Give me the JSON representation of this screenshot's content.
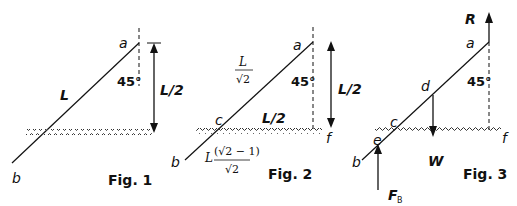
{
  "figures": [
    {
      "id": "fig1",
      "caption": "Fig. 1",
      "labels": {
        "top": "a",
        "bottom": "b",
        "rod_length": "L",
        "angle": "45°",
        "height": "L/2"
      }
    },
    {
      "id": "fig2",
      "caption": "Fig. 2",
      "labels": {
        "top": "a",
        "bottom": "b",
        "waterline_point": "c",
        "surface_point": "f",
        "angle": "45°",
        "height": "L/2",
        "horizontal": "L/2",
        "upper_segment_num": "L",
        "upper_segment_den": "√2",
        "lower_segment_coef": "L",
        "lower_segment_num": "(√2 − 1)",
        "lower_segment_den": "√2"
      }
    },
    {
      "id": "fig3",
      "caption": "Fig. 3",
      "labels": {
        "top": "a",
        "bottom": "b",
        "waterline_point": "c",
        "midpoint": "d",
        "buoyancy_point": "e",
        "surface_point": "f",
        "angle": "45°",
        "reaction_force": "R",
        "weight": "W",
        "buoyancy_force": "F",
        "buoyancy_sub": "B"
      }
    }
  ],
  "colors": {
    "ink": "#111111",
    "background": "#ffffff"
  }
}
